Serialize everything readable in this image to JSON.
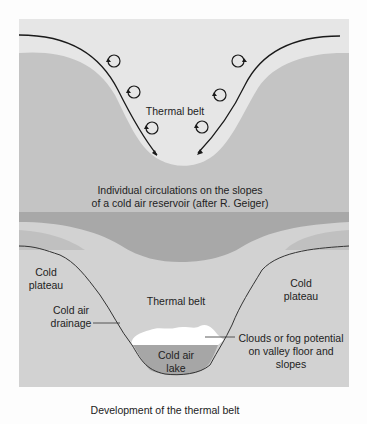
{
  "top_panel": {
    "label_thermal_belt": "Thermal belt",
    "caption_line1": "Individual circulations on the slopes",
    "caption_line2": "of a cold air reservoir (after R. Geiger)"
  },
  "bottom_panel": {
    "label_cold_plateau_left_1": "Cold",
    "label_cold_plateau_left_2": "plateau",
    "label_cold_plateau_right_1": "Cold",
    "label_cold_plateau_right_2": "plateau",
    "label_thermal_belt": "Thermal belt",
    "label_drainage_1": "Cold air",
    "label_drainage_2": "drainage",
    "label_lake_1": "Cold air",
    "label_lake_2": "lake",
    "label_clouds_1": "Clouds or fog potential",
    "label_clouds_2": "on valley floor and",
    "label_clouds_3": "slopes"
  },
  "figure_caption": "Development of the thermal belt",
  "colors": {
    "sky": "#e4e4e4",
    "ground": "#c2c2c2",
    "belt": "#d6d6d6",
    "dark_band": "#a9a9a9",
    "lake": "#a7a7a7",
    "cloud": "#ffffff",
    "line": "#1a1a1a"
  }
}
